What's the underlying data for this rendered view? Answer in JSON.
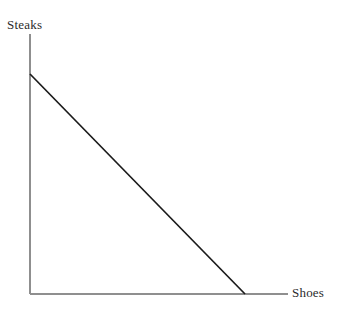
{
  "figure": {
    "background_color": "#ffffff",
    "width": 339,
    "height": 321
  },
  "chart_data": {
    "type": "line",
    "title": "",
    "subtitle": "",
    "xlabel": "Shoes",
    "ylabel": "Steaks",
    "grid": false,
    "legend": null,
    "axes": {
      "x_axis": {
        "label": "Shoes",
        "tick_labels": [],
        "show_ticks": false,
        "color": "#8f8f8f",
        "line_width": 1.4,
        "start": [
          30,
          294
        ],
        "end": [
          288,
          294
        ]
      },
      "y_axis": {
        "label": "Steaks",
        "tick_labels": [],
        "show_ticks": false,
        "color": "#8f8f8f",
        "line_width": 1.4,
        "start": [
          30,
          34
        ],
        "end": [
          30,
          294
        ]
      }
    },
    "series": [
      {
        "name": "budget-constraint",
        "color": "#1a1a1a",
        "line_width": 1.7,
        "x": [
          0,
          1
        ],
        "y": [
          1,
          0
        ],
        "points_px": [
          [
            30,
            74
          ],
          [
            245,
            294
          ]
        ],
        "description": "Downward sloping straight line from the Steaks axis intercept to the Shoes axis intercept"
      }
    ],
    "xlim": [
      0,
      1
    ],
    "ylim": [
      0,
      1
    ],
    "annotations": []
  },
  "labels": {
    "y_axis_label": "Steaks",
    "x_axis_label": "Shoes"
  },
  "colors": {
    "axis": "#8f8f8f",
    "line": "#1a1a1a",
    "text": "#2b2b2b",
    "background": "#ffffff"
  }
}
